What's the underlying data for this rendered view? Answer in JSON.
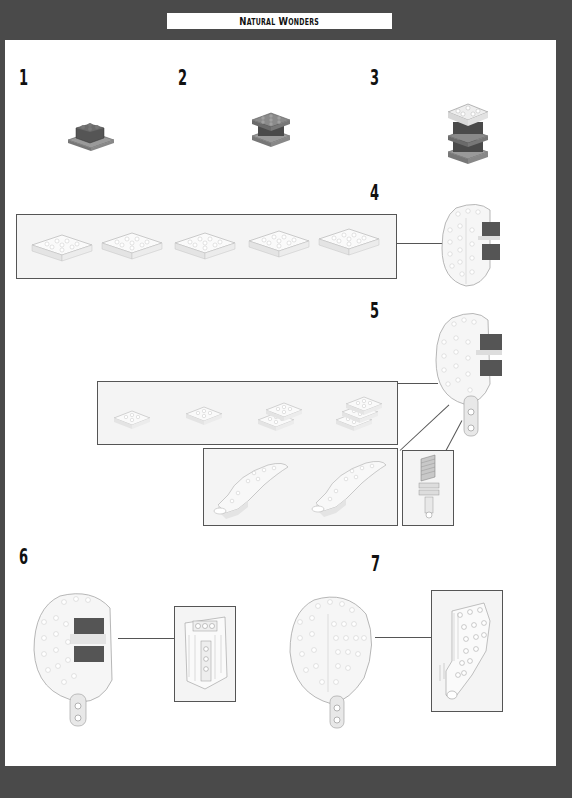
{
  "header": {
    "title": "Natural Wonders"
  },
  "steps": [
    {
      "number": "1",
      "content": "small dark-grey brick assembly on plate"
    },
    {
      "number": "2",
      "content": "dark-grey plate stack"
    },
    {
      "number": "3",
      "content": "stacked dark-grey and light-grey layers"
    },
    {
      "number": "4",
      "content": "callout of 5 white sub-assembly stages attached to side of model"
    },
    {
      "number": "5",
      "content": "callout of 4 white sub-assembly stages, plus 2 curved sections and 1 small pin piece"
    },
    {
      "number": "6",
      "content": "white dome model with callout of side panel"
    },
    {
      "number": "7",
      "content": "completed white dome model with callout of tapered side panel"
    }
  ],
  "colors": {
    "frame": "#4a4a4a",
    "page": "#ffffff",
    "callout_bg": "#f4f4f4",
    "callout_border": "#555555",
    "dark_brick": "#5a5a5a",
    "light_brick": "#e8e8e8"
  }
}
